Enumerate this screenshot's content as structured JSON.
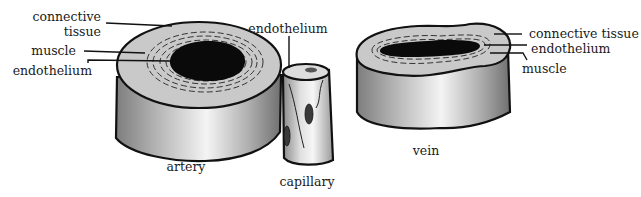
{
  "diagram": {
    "type": "labelled illustration of blood vessel cross-sections",
    "vessels": [
      {
        "id": "artery",
        "label": "artery",
        "parts": [
          "connective tissue",
          "muscle",
          "endothelium"
        ],
        "part_labels": {
          "connective_1": "connective",
          "connective_2": "tissue",
          "muscle": "muscle",
          "endothelium": "endothelium"
        }
      },
      {
        "id": "capillary",
        "label": "capillary",
        "parts": [
          "endothelium"
        ],
        "part_labels": {
          "endothelium": "endothelium"
        }
      },
      {
        "id": "vein",
        "label": "vein",
        "parts": [
          "connective tissue",
          "endothelium",
          "muscle"
        ],
        "part_labels": {
          "connective": "connective tissue",
          "endothelium": "endothelium",
          "muscle": "muscle"
        }
      }
    ],
    "colors": {
      "outline": "#111111",
      "top_face": "#c8c8c8",
      "lumen": "#0a0a0a",
      "side_dark": "#8a8a8a",
      "side_light": "#f2f2f2"
    }
  }
}
